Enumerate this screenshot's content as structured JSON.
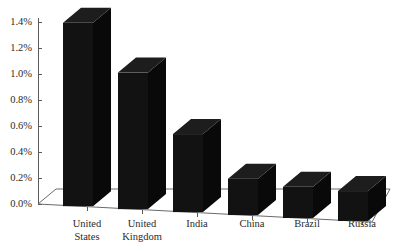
{
  "chart_data": {
    "type": "bar",
    "title": "",
    "subtitle": "",
    "xlabel": "",
    "ylabel": "",
    "categories": [
      "United States",
      "United Kingdom",
      "India",
      "China",
      "Brazil",
      "Russia"
    ],
    "category_lines": [
      [
        "United",
        "States"
      ],
      [
        "United",
        "Kingdom"
      ],
      [
        "India"
      ],
      [
        "China"
      ],
      [
        "Brazil"
      ],
      [
        "Russia"
      ]
    ],
    "values": [
      1.41,
      1.05,
      0.6,
      0.28,
      0.24,
      0.23
    ],
    "value_labels": [
      "1.41%",
      "1.05%",
      "0.60%",
      "0.28%",
      "0.24%",
      "0.23%"
    ],
    "ylim": [
      0.0,
      1.4
    ],
    "ytick_values": [
      0.0,
      0.2,
      0.4,
      0.6,
      0.8,
      1.0,
      1.2,
      1.4
    ],
    "ytick_labels": [
      "0.0%",
      "0.2%",
      "0.4%",
      "0.6%",
      "0.8%",
      "1.0%",
      "1.2%",
      "1.4%"
    ],
    "grid": false,
    "legend": null,
    "legend_position": "none",
    "style": "3d-perspective-column",
    "bar_color": "#121212",
    "bar_top_color": "#1d1d1d",
    "bar_side_color": "#090909",
    "axis_color": "#5a5a5a",
    "background_color": "#ffffff",
    "annotations": []
  },
  "axes": {
    "y_axis_name": "percentage-axis",
    "x_axis_name": "country-axis"
  }
}
